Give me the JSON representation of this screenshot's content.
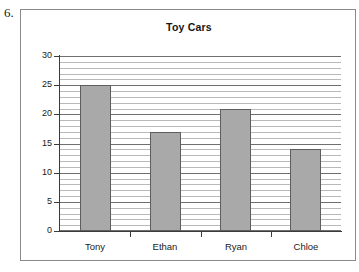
{
  "problem": {
    "number": "6."
  },
  "chart_data": {
    "type": "bar",
    "title": "Toy Cars",
    "categories": [
      "Tony",
      "Ethan",
      "Ryan",
      "Chloe"
    ],
    "values": [
      25,
      17,
      21,
      14
    ],
    "xlabel": "",
    "ylabel": "",
    "ylim": [
      0,
      30
    ],
    "ytick_labels": [
      "0",
      "5",
      "10",
      "15",
      "20",
      "25",
      "30"
    ],
    "ytick_values": [
      0,
      5,
      10,
      15,
      20,
      25,
      30
    ],
    "major_tick_step": 5,
    "minor_gridline_step": 1,
    "grid": "horizontal",
    "legend": "none",
    "colors": {
      "bar_fill": "#a9a9a9",
      "bar_border": "#5e5e5e",
      "major_gridline": "#6f6f6f",
      "minor_gridline": "#b9b9b9",
      "axis": "#3b3b3b",
      "frame_border": "#8a8a8a",
      "background": "#ffffff",
      "text": "#1a1a1a"
    }
  }
}
